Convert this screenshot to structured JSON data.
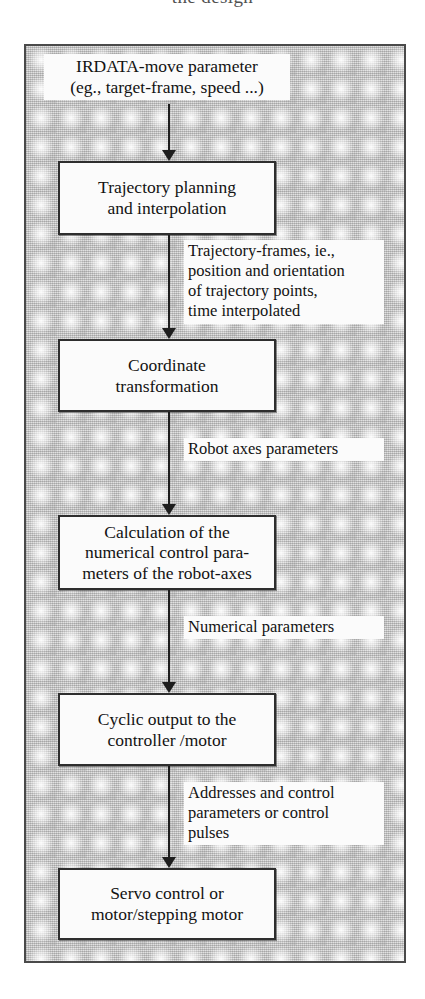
{
  "page": {
    "clipped_top_text": "the design",
    "background_color": "#d2d2d2",
    "frame_border_color": "#4a4a4a",
    "box_fill": "#fbfbfb",
    "ink_color": "#121212"
  },
  "diagram": {
    "type": "flowchart",
    "orientation": "top-to-bottom",
    "source_label": "IRDATA-move parameter\n(eg., target-frame, speed ...)",
    "nodes": [
      {
        "id": "node-1",
        "label": "Trajectory planning\nand interpolation"
      },
      {
        "id": "node-2",
        "label": "Coordinate\ntransformation"
      },
      {
        "id": "node-3",
        "label": "Calculation of the\nnumerical control para-\nmeters of the robot-axes"
      },
      {
        "id": "node-4",
        "label": "Cyclic output to the\ncontroller /motor"
      },
      {
        "id": "node-5",
        "label": "Servo control or\nmotor/stepping motor"
      }
    ],
    "edges": [
      {
        "id": "edge-0",
        "from": "source_label",
        "to": "node-1",
        "label": ""
      },
      {
        "id": "edge-1",
        "from": "node-1",
        "to": "node-2",
        "label": "Trajectory-frames, ie.,\nposition and orientation\nof trajectory points,\ntime interpolated"
      },
      {
        "id": "edge-2",
        "from": "node-2",
        "to": "node-3",
        "label": "Robot axes parameters"
      },
      {
        "id": "edge-3",
        "from": "node-3",
        "to": "node-4",
        "label": "Numerical parameters"
      },
      {
        "id": "edge-4",
        "from": "node-4",
        "to": "node-5",
        "label": "Addresses and control\nparameters or control\npulses"
      }
    ]
  }
}
